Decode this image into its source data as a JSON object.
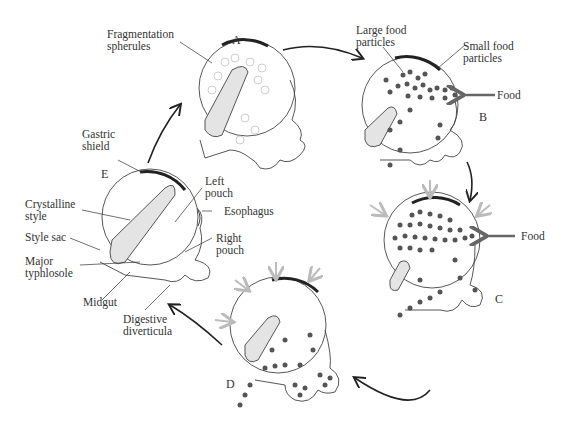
{
  "stages": {
    "A": "A",
    "B": "B",
    "C": "C",
    "D": "D",
    "E": "E"
  },
  "labels": {
    "fragmentation_spherules": [
      "Fragmentation",
      "spherules"
    ],
    "large_food_particles": [
      "Large food",
      "particles"
    ],
    "small_food_particles": [
      "Small food",
      "particles"
    ],
    "food_b": "Food",
    "food_c": "Food",
    "gastric_shield": [
      "Gastric",
      "shield"
    ],
    "crystalline_style": [
      "Crystalline",
      "style"
    ],
    "style_sac": "Style sac",
    "major_typhlosole": [
      "Major",
      "typhlosole"
    ],
    "midgut": "Midgut",
    "left_pouch": [
      "Left",
      "pouch"
    ],
    "esophagus": "Esophagus",
    "right_pouch": [
      "Right",
      "pouch"
    ],
    "digestive_diverticula": [
      "Digestive",
      "diverticula"
    ]
  },
  "colors": {
    "outline": "#333333",
    "particle": "#555555",
    "spherule": "#cfcfcf",
    "style_fill": "#e4e4e4",
    "shield": "#222222",
    "flow_arrow": "#bdbdbd",
    "food_arrow": "#666666"
  },
  "cycle_order": [
    "A",
    "B",
    "C",
    "D",
    "E"
  ]
}
